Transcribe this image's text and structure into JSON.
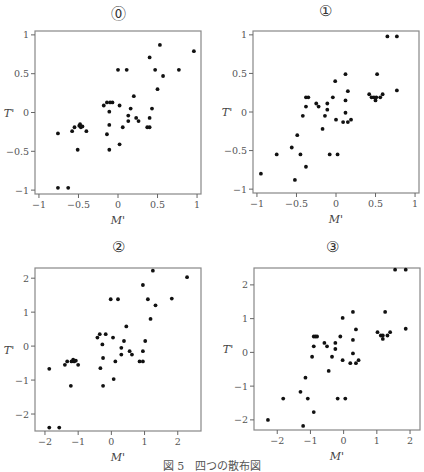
{
  "figure": {
    "caption": "図 5　四つの散布図"
  },
  "chart_data": [
    {
      "type": "scatter",
      "title": "⓪",
      "xlabel": "M'",
      "ylabel": "T'",
      "xlim": [
        -1.05,
        1.05
      ],
      "ylim": [
        -1.05,
        1.05
      ],
      "xticks": [
        -1,
        -0.5,
        0,
        0.5,
        1
      ],
      "xtick_labels": [
        "−1",
        "−0.5",
        "0",
        "0.5",
        "1"
      ],
      "yticks": [
        -1,
        -0.5,
        0,
        0.5,
        1
      ],
      "ytick_labels": [
        "−1",
        "−0.5",
        "0",
        "0.5",
        "1"
      ],
      "grid": false,
      "points": [
        [
          -0.76,
          -0.97
        ],
        [
          -0.63,
          -0.97
        ],
        [
          -0.76,
          -0.27
        ],
        [
          -0.58,
          -0.24
        ],
        [
          -0.55,
          -0.19
        ],
        [
          -0.49,
          -0.17
        ],
        [
          -0.48,
          -0.15
        ],
        [
          -0.47,
          -0.19
        ],
        [
          -0.45,
          -0.18
        ],
        [
          -0.4,
          -0.24
        ],
        [
          -0.51,
          -0.48
        ],
        [
          -0.18,
          0.09
        ],
        [
          -0.14,
          0.13
        ],
        [
          -0.1,
          0.13
        ],
        [
          -0.07,
          0.13
        ],
        [
          -0.11,
          0.01
        ],
        [
          -0.14,
          -0.28
        ],
        [
          -0.11,
          -0.16
        ],
        [
          -0.11,
          -0.48
        ],
        [
          0.0,
          0.55
        ],
        [
          0.11,
          0.55
        ],
        [
          0.02,
          0.09
        ],
        [
          0.02,
          -0.41
        ],
        [
          0.06,
          -0.19
        ],
        [
          0.2,
          0.21
        ],
        [
          0.16,
          0.05
        ],
        [
          0.13,
          -0.04
        ],
        [
          0.13,
          -0.11
        ],
        [
          0.23,
          -0.07
        ],
        [
          0.26,
          -0.11
        ],
        [
          0.37,
          -0.19
        ],
        [
          0.4,
          -0.19
        ],
        [
          0.4,
          -0.07
        ],
        [
          0.43,
          0.05
        ],
        [
          0.4,
          0.71
        ],
        [
          0.47,
          0.55
        ],
        [
          0.53,
          0.87
        ],
        [
          0.57,
          0.47
        ],
        [
          0.5,
          0.3
        ],
        [
          0.77,
          0.55
        ],
        [
          0.96,
          0.79
        ]
      ]
    },
    {
      "type": "scatter",
      "title": "①",
      "xlabel": "M'",
      "ylabel": "T'",
      "xlim": [
        -1.05,
        1.05
      ],
      "ylim": [
        -1.05,
        1.05
      ],
      "xticks": [
        -1,
        -0.5,
        0,
        0.5,
        1
      ],
      "xtick_labels": [
        "−1",
        "−0.5",
        "0",
        "0.5",
        "1"
      ],
      "yticks": [
        -1,
        -0.5,
        0,
        0.5,
        1
      ],
      "ytick_labels": [
        "−1",
        "−0.5",
        "0",
        "0.5",
        "1"
      ],
      "grid": false,
      "points": [
        [
          -0.95,
          -0.8
        ],
        [
          -0.75,
          -0.55
        ],
        [
          -0.56,
          -0.46
        ],
        [
          -0.49,
          -0.3
        ],
        [
          -0.45,
          -0.55
        ],
        [
          -0.52,
          -0.88
        ],
        [
          -0.38,
          -0.71
        ],
        [
          -0.42,
          -0.05
        ],
        [
          -0.38,
          0.07
        ],
        [
          -0.38,
          0.19
        ],
        [
          -0.35,
          0.19
        ],
        [
          -0.25,
          0.11
        ],
        [
          -0.22,
          0.07
        ],
        [
          -0.17,
          -0.22
        ],
        [
          -0.14,
          -0.05
        ],
        [
          -0.11,
          0.11
        ],
        [
          -0.11,
          0.03
        ],
        [
          -0.08,
          -0.55
        ],
        [
          -0.04,
          0.19
        ],
        [
          -0.01,
          0.4
        ],
        [
          0.0,
          -0.1
        ],
        [
          0.02,
          -0.55
        ],
        [
          0.09,
          -0.13
        ],
        [
          0.12,
          0.49
        ],
        [
          0.12,
          0.15
        ],
        [
          0.12,
          -0.01
        ],
        [
          0.15,
          0.27
        ],
        [
          0.15,
          -0.13
        ],
        [
          0.19,
          -0.1
        ],
        [
          0.42,
          0.23
        ],
        [
          0.45,
          0.19
        ],
        [
          0.48,
          0.19
        ],
        [
          0.5,
          0.15
        ],
        [
          0.51,
          0.19
        ],
        [
          0.52,
          0.49
        ],
        [
          0.56,
          0.19
        ],
        [
          0.59,
          0.23
        ],
        [
          0.65,
          0.98
        ],
        [
          0.77,
          0.98
        ],
        [
          0.77,
          0.28
        ]
      ]
    },
    {
      "type": "scatter",
      "title": "②",
      "xlabel": "M'",
      "ylabel": "T'",
      "xlim": [
        -2.3,
        2.7
      ],
      "ylim": [
        -2.5,
        2.3
      ],
      "xticks": [
        -2,
        -1,
        0,
        1,
        2
      ],
      "xtick_labels": [
        "−2",
        "−1",
        "0",
        "1",
        "2"
      ],
      "yticks": [
        -2,
        -1,
        0,
        1,
        2
      ],
      "ytick_labels": [
        "−2",
        "−1",
        "0",
        "1",
        "2"
      ],
      "grid": false,
      "points": [
        [
          -1.87,
          -2.4
        ],
        [
          -1.57,
          -2.4
        ],
        [
          -1.87,
          -0.67
        ],
        [
          -1.4,
          -0.55
        ],
        [
          -1.33,
          -0.45
        ],
        [
          -1.2,
          -0.45
        ],
        [
          -1.15,
          -0.4
        ],
        [
          -1.12,
          -0.45
        ],
        [
          -1.07,
          -0.43
        ],
        [
          -1.0,
          -0.55
        ],
        [
          -1.22,
          -1.17
        ],
        [
          -0.42,
          0.25
        ],
        [
          -0.35,
          0.35
        ],
        [
          -0.17,
          0.35
        ],
        [
          -0.27,
          0.05
        ],
        [
          -0.33,
          -0.65
        ],
        [
          -0.25,
          -0.35
        ],
        [
          -0.25,
          -1.17
        ],
        [
          -0.02,
          1.38
        ],
        [
          0.2,
          1.38
        ],
        [
          0.05,
          0.25
        ],
        [
          0.12,
          -0.45
        ],
        [
          0.07,
          -0.97
        ],
        [
          0.3,
          -0.05
        ],
        [
          0.3,
          -0.25
        ],
        [
          0.38,
          0.15
        ],
        [
          0.45,
          0.58
        ],
        [
          0.55,
          -0.15
        ],
        [
          0.62,
          -0.25
        ],
        [
          0.85,
          -0.45
        ],
        [
          0.95,
          -0.45
        ],
        [
          0.95,
          -0.15
        ],
        [
          1.02,
          0.15
        ],
        [
          0.95,
          1.8
        ],
        [
          1.1,
          1.38
        ],
        [
          1.18,
          0.8
        ],
        [
          1.25,
          2.22
        ],
        [
          1.33,
          1.2
        ],
        [
          1.82,
          1.4
        ],
        [
          2.28,
          2.03
        ]
      ]
    },
    {
      "type": "scatter",
      "title": "③",
      "xlabel": "M'",
      "ylabel": "T'",
      "xlim": [
        -2.7,
        2.3
      ],
      "ylim": [
        -2.3,
        2.5
      ],
      "xticks": [
        -2,
        -1,
        0,
        1,
        2
      ],
      "xtick_labels": [
        "−2",
        "−1",
        "0",
        "1",
        "2"
      ],
      "yticks": [
        -2,
        -1,
        0,
        1,
        2
      ],
      "ytick_labels": [
        "−2",
        "−1",
        "0",
        "1",
        "2"
      ],
      "grid": false,
      "points": [
        [
          -2.28,
          -2.0
        ],
        [
          -1.82,
          -1.37
        ],
        [
          -1.3,
          -1.17
        ],
        [
          -1.22,
          -2.18
        ],
        [
          -1.15,
          -0.75
        ],
        [
          -1.08,
          -1.37
        ],
        [
          -0.95,
          -0.13
        ],
        [
          -0.9,
          0.47
        ],
        [
          -0.9,
          0.18
        ],
        [
          -0.85,
          0.47
        ],
        [
          -0.8,
          0.47
        ],
        [
          -0.9,
          -1.77
        ],
        [
          -0.58,
          0.28
        ],
        [
          -0.5,
          0.18
        ],
        [
          -0.45,
          -0.55
        ],
        [
          -0.35,
          -0.13
        ],
        [
          -0.25,
          0.28
        ],
        [
          -0.25,
          0.1
        ],
        [
          -0.18,
          -1.37
        ],
        [
          -0.1,
          0.47
        ],
        [
          -0.03,
          1.02
        ],
        [
          -0.03,
          -0.23
        ],
        [
          0.05,
          -1.37
        ],
        [
          0.2,
          -0.32
        ],
        [
          0.28,
          0.37
        ],
        [
          0.28,
          -0.03
        ],
        [
          0.28,
          1.2
        ],
        [
          0.37,
          0.68
        ],
        [
          0.37,
          -0.32
        ],
        [
          0.45,
          -0.23
        ],
        [
          1.02,
          0.6
        ],
        [
          1.12,
          0.5
        ],
        [
          1.18,
          0.5
        ],
        [
          1.18,
          0.4
        ],
        [
          1.25,
          1.2
        ],
        [
          1.32,
          0.5
        ],
        [
          1.4,
          0.6
        ],
        [
          1.55,
          2.45
        ],
        [
          1.87,
          2.45
        ],
        [
          1.87,
          0.7
        ]
      ]
    }
  ]
}
